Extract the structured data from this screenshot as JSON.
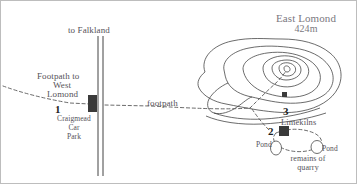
{
  "map": {
    "title": "East Lomond walking route map",
    "peak": {
      "name": "East Lomond",
      "altitude": "424m"
    },
    "labels": {
      "to_falkland": "to Falkland",
      "footpath_west_line1": "Footpath to",
      "footpath_west_line2": "West",
      "footpath_west_line3": "Lomond",
      "carpark_line1": "Craigmead",
      "carpark_line2": "Car",
      "carpark_line3": "Park",
      "footpath_mid": "footpath",
      "limekilns": "Limekilns",
      "pond_left": "Pond",
      "pond_right": "Pond",
      "quarry_line1": "remains of",
      "quarry_line2": "quarry"
    },
    "markers": [
      {
        "number": "1",
        "name": "Craigmead Car Park"
      },
      {
        "number": "2",
        "name": "Limekilns"
      },
      {
        "number": "3",
        "name": "Summit area"
      }
    ],
    "colors": {
      "background": "#ffffff",
      "text": "#555258",
      "peak_text": "#7b7880",
      "contour_line": "#3b3b3b",
      "path_dashed": "#5a5a5a",
      "road_line": "#2e2e2e",
      "marker_fill": "#3a3a3a",
      "border": "#b9b9b9"
    },
    "features": {
      "road_label": "road to Falkland",
      "footpath_label": "dashed footpath",
      "contours_label": "hill contour lines",
      "ponds_count": "2"
    }
  }
}
